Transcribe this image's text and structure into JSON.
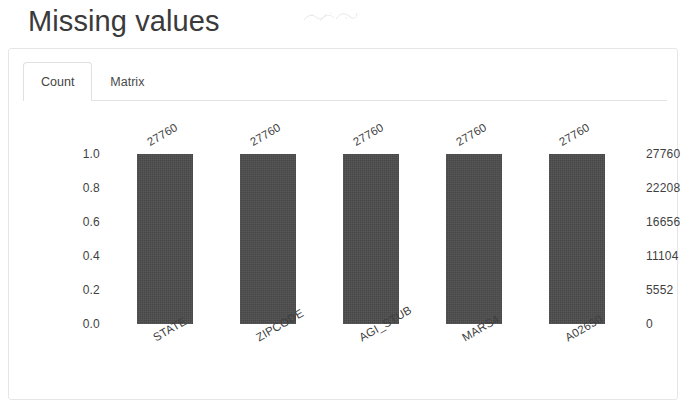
{
  "page": {
    "title": "Missing values"
  },
  "card": {
    "tabs": [
      {
        "id": "count",
        "label": "Count",
        "active": true
      },
      {
        "id": "matrix",
        "label": "Matrix",
        "active": false
      }
    ]
  },
  "chart_data": {
    "type": "bar",
    "title": "Missing values",
    "xlabel": "",
    "ylabel": "",
    "categories": [
      "STATE",
      "ZIPCODE",
      "AGI_STUB",
      "MARS4",
      "A02650"
    ],
    "values": [
      27760,
      27760,
      27760,
      27760,
      27760
    ],
    "data_labels": [
      "27760",
      "27760",
      "27760",
      "27760",
      "27760"
    ],
    "bar_color": "#4c4c4c",
    "grid": false,
    "legend": null,
    "y_axis_left": {
      "ticks": [
        "1.0",
        "0.8",
        "0.6",
        "0.4",
        "0.2",
        "0.0"
      ],
      "values": [
        1.0,
        0.8,
        0.6,
        0.4,
        0.2,
        0.0
      ],
      "ylim": [
        0.0,
        1.0
      ]
    },
    "y_axis_right": {
      "ticks": [
        "27760",
        "22208",
        "16656",
        "11104",
        "5552",
        "0"
      ],
      "values": [
        27760,
        22208,
        16656,
        11104,
        5552,
        0
      ],
      "ylim": [
        0,
        27760
      ]
    }
  }
}
